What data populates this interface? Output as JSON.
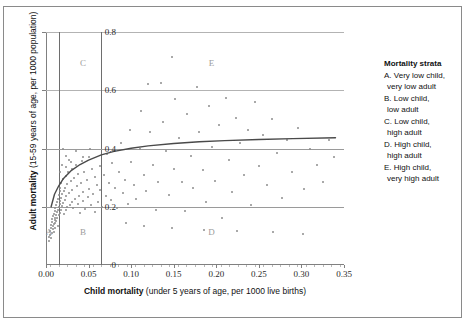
{
  "chart_data": {
    "type": "scatter",
    "title": "",
    "xlabel": "Child mortality (under 5 years of age, per 1000 live births)",
    "xlabel_bold": "Child mortality",
    "xlabel_rest": " (under 5 years of age, per 1000 live births)",
    "ylabel": "Adult mortality (15-59 years of age, per 1000 population)",
    "ylabel_bold": "Adult mortality",
    "ylabel_rest": " (15-59 years of age, per 1000 population)",
    "xlim": [
      0.0,
      0.35
    ],
    "ylim": [
      0.0,
      0.8
    ],
    "xticks": [
      "0.00",
      "0.05",
      "0.10",
      "0.15",
      "0.20",
      "0.25",
      "0.30",
      "0.35"
    ],
    "xtick_values": [
      0.0,
      0.05,
      0.1,
      0.15,
      0.2,
      0.25,
      0.3,
      0.35
    ],
    "yticks": [
      "0",
      "0.2",
      "0.4",
      "0.6",
      "0.8"
    ],
    "ytick_values": [
      0,
      0.2,
      0.4,
      0.6,
      0.8
    ],
    "grid": "horizontal gridlines at 0.2, 0.4, 0.6, 0.8",
    "legend_position": "right",
    "strata_dividers": {
      "vertical_x": [
        0.015,
        0.065
      ],
      "horizontal_y": [
        0.2,
        0.4
      ]
    },
    "zone_labels": [
      {
        "label": "A",
        "x": 0.0035,
        "y": 0.115
      },
      {
        "label": "B",
        "x": 0.0435,
        "y": 0.115
      },
      {
        "label": "C",
        "x": 0.0435,
        "y": 0.695
      },
      {
        "label": "D",
        "x": 0.1945,
        "y": 0.115
      },
      {
        "label": "E",
        "x": 0.1945,
        "y": 0.695
      }
    ],
    "fit_curve": {
      "description": "logarithmic trend line of adult mortality vs child mortality",
      "points": [
        [
          0.006,
          0.2
        ],
        [
          0.01,
          0.243
        ],
        [
          0.015,
          0.272
        ],
        [
          0.02,
          0.295
        ],
        [
          0.03,
          0.325
        ],
        [
          0.04,
          0.345
        ],
        [
          0.05,
          0.36
        ],
        [
          0.065,
          0.378
        ],
        [
          0.08,
          0.39
        ],
        [
          0.1,
          0.401
        ],
        [
          0.12,
          0.409
        ],
        [
          0.15,
          0.417
        ],
        [
          0.18,
          0.423
        ],
        [
          0.21,
          0.427
        ],
        [
          0.25,
          0.431
        ],
        [
          0.29,
          0.434
        ],
        [
          0.34,
          0.437
        ]
      ]
    },
    "points": [
      [
        0.004,
        0.083
      ],
      [
        0.004,
        0.097
      ],
      [
        0.005,
        0.104
      ],
      [
        0.005,
        0.118
      ],
      [
        0.006,
        0.092
      ],
      [
        0.006,
        0.126
      ],
      [
        0.006,
        0.138
      ],
      [
        0.007,
        0.11
      ],
      [
        0.007,
        0.147
      ],
      [
        0.007,
        0.158
      ],
      [
        0.008,
        0.122
      ],
      [
        0.008,
        0.133
      ],
      [
        0.008,
        0.168
      ],
      [
        0.009,
        0.141
      ],
      [
        0.009,
        0.176
      ],
      [
        0.009,
        0.112
      ],
      [
        0.01,
        0.155
      ],
      [
        0.01,
        0.186
      ],
      [
        0.01,
        0.128
      ],
      [
        0.011,
        0.163
      ],
      [
        0.011,
        0.197
      ],
      [
        0.011,
        0.143
      ],
      [
        0.012,
        0.172
      ],
      [
        0.012,
        0.205
      ],
      [
        0.012,
        0.15
      ],
      [
        0.013,
        0.181
      ],
      [
        0.013,
        0.215
      ],
      [
        0.013,
        0.16
      ],
      [
        0.014,
        0.19
      ],
      [
        0.014,
        0.225
      ],
      [
        0.014,
        0.133
      ],
      [
        0.015,
        0.199
      ],
      [
        0.015,
        0.241
      ],
      [
        0.015,
        0.17
      ],
      [
        0.016,
        0.208
      ],
      [
        0.016,
        0.255
      ],
      [
        0.016,
        0.18
      ],
      [
        0.017,
        0.219
      ],
      [
        0.017,
        0.265
      ],
      [
        0.018,
        0.19
      ],
      [
        0.018,
        0.23
      ],
      [
        0.018,
        0.282
      ],
      [
        0.019,
        0.201
      ],
      [
        0.019,
        0.243
      ],
      [
        0.02,
        0.295
      ],
      [
        0.02,
        0.212
      ],
      [
        0.021,
        0.253
      ],
      [
        0.021,
        0.175
      ],
      [
        0.022,
        0.265
      ],
      [
        0.022,
        0.222
      ],
      [
        0.023,
        0.305
      ],
      [
        0.023,
        0.188
      ],
      [
        0.024,
        0.236
      ],
      [
        0.025,
        0.277
      ],
      [
        0.025,
        0.198
      ],
      [
        0.026,
        0.318
      ],
      [
        0.027,
        0.246
      ],
      [
        0.028,
        0.205
      ],
      [
        0.029,
        0.287
      ],
      [
        0.03,
        0.33
      ],
      [
        0.03,
        0.218
      ],
      [
        0.031,
        0.259
      ],
      [
        0.032,
        0.196
      ],
      [
        0.033,
        0.298
      ],
      [
        0.034,
        0.228
      ],
      [
        0.035,
        0.345
      ],
      [
        0.036,
        0.27
      ],
      [
        0.037,
        0.208
      ],
      [
        0.038,
        0.311
      ],
      [
        0.039,
        0.238
      ],
      [
        0.04,
        0.18
      ],
      [
        0.041,
        0.283
      ],
      [
        0.042,
        0.358
      ],
      [
        0.043,
        0.221
      ],
      [
        0.044,
        0.25
      ],
      [
        0.045,
        0.32
      ],
      [
        0.046,
        0.192
      ],
      [
        0.048,
        0.292
      ],
      [
        0.049,
        0.233
      ],
      [
        0.05,
        0.37
      ],
      [
        0.051,
        0.262
      ],
      [
        0.053,
        0.205
      ],
      [
        0.054,
        0.33
      ],
      [
        0.055,
        0.245
      ],
      [
        0.057,
        0.302
      ],
      [
        0.058,
        0.182
      ],
      [
        0.06,
        0.274
      ],
      [
        0.061,
        0.215
      ],
      [
        0.063,
        0.34
      ],
      [
        0.064,
        0.256
      ],
      [
        0.066,
        0.2
      ],
      [
        0.068,
        0.31
      ],
      [
        0.07,
        0.238
      ],
      [
        0.072,
        0.38
      ],
      [
        0.074,
        0.282
      ],
      [
        0.076,
        0.222
      ],
      [
        0.078,
        0.35
      ],
      [
        0.081,
        0.265
      ],
      [
        0.083,
        0.195
      ],
      [
        0.086,
        0.32
      ],
      [
        0.088,
        0.42
      ],
      [
        0.09,
        0.248
      ],
      [
        0.093,
        0.292
      ],
      [
        0.096,
        0.21
      ],
      [
        0.099,
        0.465
      ],
      [
        0.1,
        0.352
      ],
      [
        0.103,
        0.275
      ],
      [
        0.106,
        0.228
      ],
      [
        0.11,
        0.4
      ],
      [
        0.112,
        0.53
      ],
      [
        0.115,
        0.31
      ],
      [
        0.118,
        0.255
      ],
      [
        0.12,
        0.62
      ],
      [
        0.122,
        0.455
      ],
      [
        0.126,
        0.345
      ],
      [
        0.129,
        0.19
      ],
      [
        0.132,
        0.285
      ],
      [
        0.135,
        0.625
      ],
      [
        0.138,
        0.49
      ],
      [
        0.141,
        0.39
      ],
      [
        0.145,
        0.24
      ],
      [
        0.148,
        0.715
      ],
      [
        0.15,
        0.33
      ],
      [
        0.152,
        0.57
      ],
      [
        0.156,
        0.435
      ],
      [
        0.16,
        0.285
      ],
      [
        0.163,
        0.185
      ],
      [
        0.166,
        0.52
      ],
      [
        0.17,
        0.375
      ],
      [
        0.173,
        0.265
      ],
      [
        0.177,
        0.61
      ],
      [
        0.18,
        0.455
      ],
      [
        0.184,
        0.325
      ],
      [
        0.188,
        0.215
      ],
      [
        0.191,
        0.545
      ],
      [
        0.195,
        0.405
      ],
      [
        0.199,
        0.29
      ],
      [
        0.203,
        0.48
      ],
      [
        0.207,
        0.16
      ],
      [
        0.211,
        0.575
      ],
      [
        0.215,
        0.36
      ],
      [
        0.219,
        0.25
      ],
      [
        0.223,
        0.505
      ],
      [
        0.228,
        0.42
      ],
      [
        0.232,
        0.31
      ],
      [
        0.237,
        0.465
      ],
      [
        0.241,
        0.205
      ],
      [
        0.246,
        0.56
      ],
      [
        0.25,
        0.34
      ],
      [
        0.255,
        0.445
      ],
      [
        0.26,
        0.275
      ],
      [
        0.266,
        0.5
      ],
      [
        0.271,
        0.385
      ],
      [
        0.277,
        0.23
      ],
      [
        0.283,
        0.43
      ],
      [
        0.289,
        0.32
      ],
      [
        0.296,
        0.47
      ],
      [
        0.303,
        0.26
      ],
      [
        0.31,
        0.4
      ],
      [
        0.318,
        0.345
      ],
      [
        0.325,
        0.285
      ],
      [
        0.332,
        0.43
      ],
      [
        0.338,
        0.37
      ],
      [
        0.094,
        0.145
      ],
      [
        0.115,
        0.135
      ],
      [
        0.148,
        0.128
      ],
      [
        0.186,
        0.12
      ],
      [
        0.224,
        0.118
      ],
      [
        0.267,
        0.112
      ],
      [
        0.302,
        0.108
      ],
      [
        0.02,
        0.4
      ],
      [
        0.024,
        0.375
      ],
      [
        0.029,
        0.355
      ],
      [
        0.035,
        0.392
      ],
      [
        0.043,
        0.372
      ],
      [
        0.052,
        0.398
      ],
      [
        0.019,
        0.345
      ],
      [
        0.016,
        0.32
      ],
      [
        0.023,
        0.335
      ],
      [
        0.027,
        0.362
      ]
    ]
  },
  "legend": {
    "title": "Mortality strata",
    "entries": [
      {
        "line1": "A. Very low child,",
        "line2": "very low adult"
      },
      {
        "line1": "B. Low child,",
        "line2": "low adult"
      },
      {
        "line1": "C. Low child,",
        "line2": "high adult"
      },
      {
        "line1": "D. High child,",
        "line2": "high adult"
      },
      {
        "line1": "E. High child,",
        "line2": "very high adult"
      }
    ]
  },
  "colors": {
    "point": "#8d8d8d",
    "curve": "#4a4a4a",
    "gridline": "#b3b3b3",
    "divider": "#6e6e6e",
    "frame": "#808080",
    "text": "#111111",
    "zone_label": "#9c9c9c"
  }
}
